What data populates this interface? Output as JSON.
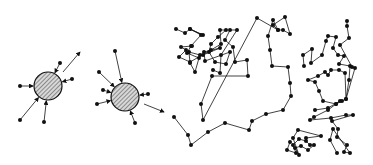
{
  "figure": {
    "colors": {
      "ink": "#111111",
      "fill": "#bdbdbd",
      "background": "#ffffff"
    },
    "particles": [
      {
        "cx": 48,
        "cy": 86,
        "r": 14,
        "molecules": [
          [
            20,
            86
          ],
          [
            60,
            63
          ],
          [
            72,
            79
          ],
          [
            20,
            120
          ],
          [
            44,
            122
          ]
        ],
        "motion_arrow": {
          "from": [
            63,
            72
          ],
          "to": [
            80,
            52
          ]
        }
      },
      {
        "cx": 125,
        "cy": 97,
        "r": 14,
        "molecules": [
          [
            115,
            51
          ],
          [
            99,
            72
          ],
          [
            103,
            90
          ],
          [
            97,
            104
          ],
          [
            148,
            94
          ],
          [
            135,
            123
          ]
        ],
        "motion_arrow": {
          "from": [
            144,
            104
          ],
          "to": [
            164,
            112
          ]
        }
      }
    ],
    "trajectory": [
      [
        174,
        117
      ],
      [
        188,
        135
      ],
      [
        191,
        145
      ],
      [
        208,
        132
      ],
      [
        225,
        123
      ],
      [
        249,
        130
      ],
      [
        252,
        121
      ],
      [
        266,
        114
      ],
      [
        283,
        110
      ],
      [
        291,
        96
      ],
      [
        290,
        83
      ],
      [
        288,
        67
      ],
      [
        272,
        66
      ],
      [
        270,
        50
      ],
      [
        268,
        36
      ],
      [
        273,
        20
      ],
      [
        278,
        30
      ],
      [
        283,
        30
      ],
      [
        290,
        34
      ],
      [
        285,
        17
      ],
      [
        273,
        25
      ],
      [
        278,
        30
      ],
      [
        257,
        18
      ],
      [
        203,
        120
      ],
      [
        201,
        104
      ],
      [
        212,
        76
      ],
      [
        248,
        76
      ],
      [
        247,
        60
      ],
      [
        235,
        62
      ],
      [
        233,
        47
      ],
      [
        225,
        40
      ],
      [
        230,
        30
      ],
      [
        237,
        30
      ],
      [
        221,
        55
      ],
      [
        220,
        73
      ],
      [
        213,
        70
      ]
    ],
    "cluster_a": [
      [
        176,
        29
      ],
      [
        185,
        33
      ],
      [
        190,
        29
      ],
      [
        203,
        35
      ],
      [
        190,
        29
      ],
      [
        201,
        35
      ],
      [
        191,
        46
      ],
      [
        187,
        53
      ],
      [
        199,
        58
      ],
      [
        195,
        72
      ],
      [
        190,
        63
      ],
      [
        189,
        52
      ],
      [
        200,
        55
      ],
      [
        203,
        55
      ],
      [
        220,
        48
      ],
      [
        204,
        52
      ],
      [
        205,
        61
      ],
      [
        230,
        52
      ],
      [
        226,
        64
      ],
      [
        215,
        62
      ],
      [
        209,
        52
      ],
      [
        211,
        44
      ],
      [
        218,
        37
      ],
      [
        226,
        30
      ],
      [
        220,
        30
      ],
      [
        221,
        44
      ],
      [
        211,
        50
      ],
      [
        190,
        62
      ],
      [
        179,
        57
      ],
      [
        186,
        50
      ],
      [
        181,
        47
      ],
      [
        192,
        46
      ]
    ],
    "cluster_b": [
      [
        290,
        142
      ],
      [
        287,
        150
      ],
      [
        296,
        153
      ],
      [
        293,
        145
      ],
      [
        299,
        139
      ],
      [
        306,
        141
      ],
      [
        310,
        145
      ],
      [
        314,
        145
      ],
      [
        308,
        150
      ],
      [
        301,
        146
      ],
      [
        295,
        148
      ],
      [
        299,
        155
      ],
      [
        293,
        138
      ],
      [
        298,
        130
      ],
      [
        321,
        136
      ],
      [
        306,
        138
      ]
    ],
    "cluster_c": [
      [
        304,
        66
      ],
      [
        303,
        55
      ],
      [
        312,
        49
      ],
      [
        311,
        63
      ],
      [
        322,
        55
      ],
      [
        326,
        41
      ],
      [
        328,
        36
      ],
      [
        336,
        37
      ],
      [
        333,
        48
      ],
      [
        338,
        55
      ],
      [
        344,
        56
      ],
      [
        339,
        64
      ],
      [
        350,
        66
      ],
      [
        349,
        80
      ],
      [
        346,
        99
      ],
      [
        345,
        73
      ],
      [
        339,
        70
      ],
      [
        331,
        70
      ],
      [
        328,
        75
      ],
      [
        325,
        72
      ],
      [
        318,
        76
      ],
      [
        308,
        80
      ],
      [
        315,
        82
      ],
      [
        319,
        91
      ],
      [
        323,
        101
      ],
      [
        336,
        104
      ],
      [
        342,
        101
      ],
      [
        346,
        99
      ],
      [
        355,
        68
      ],
      [
        352,
        67
      ],
      [
        340,
        45
      ],
      [
        349,
        38
      ],
      [
        347,
        26
      ],
      [
        347,
        21
      ]
    ],
    "cluster_d": [
      [
        315,
        110
      ],
      [
        328,
        108
      ],
      [
        340,
        101
      ],
      [
        336,
        104
      ],
      [
        328,
        110
      ],
      [
        314,
        117
      ],
      [
        310,
        120
      ],
      [
        331,
        118
      ],
      [
        346,
        115
      ],
      [
        353,
        115
      ],
      [
        332,
        121
      ],
      [
        338,
        129
      ],
      [
        337,
        137
      ],
      [
        347,
        145
      ],
      [
        344,
        152
      ],
      [
        350,
        153
      ],
      [
        333,
        129
      ],
      [
        330,
        140
      ],
      [
        337,
        153
      ]
    ]
  }
}
